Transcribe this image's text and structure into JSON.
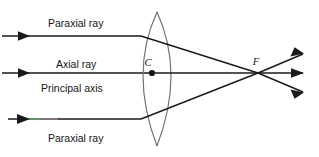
{
  "figure": {
    "background_color": "#ffffff",
    "ink_color": "#1a1a1a",
    "lens_outline_color": "#6e6e78",
    "axis_color": "#4a4a52",
    "fringe_green_color": "#63c264",
    "fringe_magenta_color": "#c9a2c2",
    "width": 319,
    "height": 157
  },
  "labels": {
    "paraxial_ray_top": "Paraxial ray",
    "axial_ray": "Axial ray",
    "principal_axis": "Principal axis",
    "paraxial_ray_bottom": "Paraxial ray",
    "lens_center": "C",
    "focal_point": "F"
  },
  "geometry": {
    "principal_axis_y": 73,
    "top_ray_y": 36,
    "bottom_ray_y": 119,
    "lens_center_x": 153,
    "lens_top_apex_y": 12,
    "lens_bottom_apex_y": 146,
    "lens_half_width_at_axis": 19,
    "focal_point_x": 258,
    "focal_point_y": 73,
    "ray_exit_x": 303,
    "exit_top_y": 54,
    "exit_axis_y": 73,
    "exit_bottom_y": 92,
    "incoming_arrow_tip_x": 30
  },
  "elements": {
    "top_incoming_ray": "paraxial-ray-incoming-top",
    "axial_incoming_ray": "axial-ray-incoming",
    "bottom_incoming_ray": "paraxial-ray-incoming-bottom",
    "lens": "converging-lens",
    "refracted_top": "refracted-ray-top",
    "refracted_axis": "refracted-ray-axis",
    "refracted_bottom": "refracted-ray-bottom"
  }
}
